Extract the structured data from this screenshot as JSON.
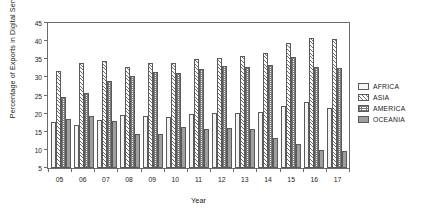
{
  "chart_data": {
    "type": "bar",
    "title": "",
    "xlabel": "Year",
    "ylabel": "Percentage of Exports in Digital Services",
    "ylim": [
      5,
      45
    ],
    "yticks": [
      5,
      10,
      15,
      20,
      25,
      30,
      35,
      40,
      45
    ],
    "grid": false,
    "legend_position": "right",
    "categories": [
      "05",
      "06",
      "07",
      "08",
      "09",
      "10",
      "11",
      "12",
      "13",
      "14",
      "15",
      "16",
      "17"
    ],
    "series": [
      {
        "name": "AFRICA",
        "pattern": "light-dotted",
        "values": [
          17.6,
          16.8,
          18.2,
          19.6,
          19.4,
          19.0,
          20.0,
          20.1,
          20.3,
          20.5,
          22.0,
          23.2,
          21.6
        ]
      },
      {
        "name": "ASIA",
        "pattern": "diagonal-hatch",
        "values": [
          31.8,
          34.1,
          34.4,
          33.0,
          33.9,
          34.1,
          35.1,
          35.4,
          36.0,
          36.8,
          39.4,
          40.9,
          40.5
        ]
      },
      {
        "name": "AMERICA",
        "pattern": "grid-hatch",
        "values": [
          24.7,
          25.6,
          29.1,
          30.4,
          31.4,
          31.3,
          32.4,
          33.2,
          33.0,
          33.4,
          35.5,
          33.0,
          32.7
        ]
      },
      {
        "name": "OCEANIA",
        "pattern": "solid-gray",
        "values": [
          18.5,
          19.4,
          18.0,
          14.3,
          14.3,
          16.2,
          15.8,
          16.0,
          15.9,
          13.2,
          11.6,
          10.0,
          9.7
        ]
      }
    ]
  },
  "legend": {
    "items": [
      {
        "label": "AFRICA"
      },
      {
        "label": "ASIA"
      },
      {
        "label": "AMERICA"
      },
      {
        "label": "OCEANIA"
      }
    ]
  },
  "colors": {
    "axis": "#6b6b6b",
    "text": "#1a1a1a",
    "africa": "#f4f4f4",
    "asia": "#fbfbfb",
    "america": "#f7f7f7",
    "oceania": "#9e9e9e"
  }
}
